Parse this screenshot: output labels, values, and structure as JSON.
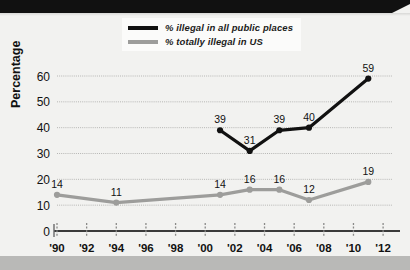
{
  "chart_data": {
    "type": "line",
    "title": "",
    "subtitle": "",
    "xlabel": "",
    "ylabel": "Percentage",
    "x": [
      1990,
      1992,
      1994,
      1996,
      1998,
      2000,
      2002,
      2004,
      2006,
      2008,
      2010,
      2012
    ],
    "tick_labels": [
      "'90",
      "'92",
      "'94",
      "'96",
      "'98",
      "'00",
      "'02",
      "'04",
      "'06",
      "'08",
      "'10",
      "'12"
    ],
    "ylim": [
      0,
      62
    ],
    "y_ticks": [
      0,
      10,
      20,
      30,
      40,
      50,
      60
    ],
    "y_tick_labels": [
      "0",
      "10",
      "20",
      "30",
      "40",
      "50",
      "60"
    ],
    "grid": true,
    "legend_position": "top-center",
    "series": [
      {
        "name": "% illegal in all public places",
        "color": "#111111",
        "points": [
          {
            "x": 2001,
            "y": 39,
            "label": "39"
          },
          {
            "x": 2003,
            "y": 31,
            "label": "31"
          },
          {
            "x": 2005,
            "y": 39,
            "label": "39"
          },
          {
            "x": 2007,
            "y": 40,
            "label": "40"
          },
          {
            "x": 2011,
            "y": 59,
            "label": "59"
          }
        ]
      },
      {
        "name": "% totally illegal in US",
        "color": "#9d9d9b",
        "points": [
          {
            "x": 1990,
            "y": 14,
            "label": "14"
          },
          {
            "x": 1994,
            "y": 11,
            "label": "11"
          },
          {
            "x": 2001,
            "y": 14,
            "label": "14"
          },
          {
            "x": 2003,
            "y": 16,
            "label": "16"
          },
          {
            "x": 2005,
            "y": 16,
            "label": "16"
          },
          {
            "x": 2007,
            "y": 12,
            "label": "12"
          },
          {
            "x": 2011,
            "y": 19,
            "label": "19"
          }
        ]
      }
    ]
  },
  "legend": {
    "items": [
      {
        "label": "% illegal in all public places",
        "color": "#111111"
      },
      {
        "label": "% totally illegal in US",
        "color": "#9d9d9b"
      }
    ]
  },
  "axis": {
    "y_title": "Percentage"
  },
  "colors": {
    "series_black": "#111111",
    "series_gray": "#9d9d9b",
    "background": "#f2f2f0",
    "gridline": "#b6b6b4",
    "axis": "#333333",
    "top_bar": "#111111",
    "bottom_band": "#b9b9b7"
  }
}
